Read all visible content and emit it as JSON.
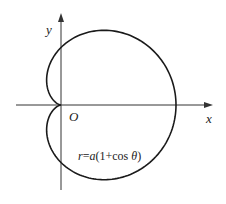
{
  "chart_data": {
    "type": "line",
    "title": "",
    "curve": "cardioid",
    "equation": "r=a(1+cos θ)",
    "equation_parts": {
      "lhs": "r",
      "eq": "=",
      "a": "a",
      "open": "(1+cos ",
      "theta": "θ",
      "close": ")"
    },
    "xlabel": "x",
    "ylabel": "y",
    "origin_label": "O",
    "parameter_a": 1,
    "xlim": [
      -0.5,
      2.5
    ],
    "ylim": [
      -1.6,
      1.6
    ],
    "grid": false,
    "legend": "none",
    "series": [
      {
        "name": "r=a(1+cos θ)",
        "polar": true,
        "r_of_theta": "a*(1+cos(theta))",
        "theta_range": [
          0,
          6.2832
        ]
      }
    ]
  },
  "colors": {
    "stroke": "#1a1a1a",
    "background": "#ffffff",
    "text": "#222222"
  },
  "layout_px": {
    "origin_x": 61,
    "origin_y": 105,
    "a_px": 57.5
  }
}
